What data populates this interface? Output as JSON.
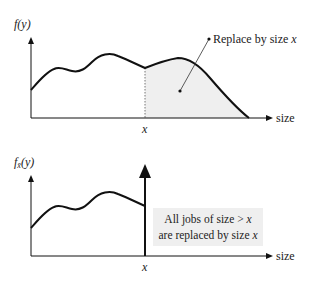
{
  "top_plot": {
    "y_label": "f(y)",
    "x_label": "size",
    "x_tick": "x",
    "annotation": "Replace by size x",
    "annotation_parts": {
      "text": "Replace by size ",
      "var": "x"
    },
    "shade_color": "#efefef"
  },
  "bottom_plot": {
    "y_label_f": "f",
    "y_label_sub": "x̄",
    "y_label_rest": "(y)",
    "x_label": "size",
    "x_tick": "x",
    "box_line1_text": "All jobs of size > ",
    "box_line1_var": "x",
    "box_line2_text": "are replaced by size ",
    "box_line2_var": "x"
  }
}
